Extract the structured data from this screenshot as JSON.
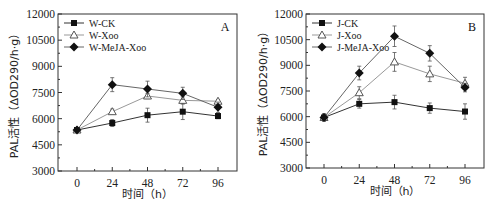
{
  "chart_data": [
    {
      "type": "line",
      "panel_label": "A",
      "title": "",
      "xlabel": "时间（h）",
      "ylabel": "PAL活性（ΔOD290/h·g）",
      "x": [
        0,
        24,
        48,
        72,
        96
      ],
      "x_ticks": [
        "0",
        "24",
        "48",
        "72",
        "96"
      ],
      "y_ticks": [
        "3000",
        "4500",
        "6000",
        "7500",
        "9000",
        "10500",
        "12000"
      ],
      "ylim": [
        3000,
        12000
      ],
      "grid": false,
      "legend_position": "upper-left",
      "series": [
        {
          "name": "W-CK",
          "marker": "filled-square",
          "values": [
            5350,
            5750,
            6200,
            6400,
            6150
          ],
          "errors": [
            80,
            200,
            400,
            450,
            150
          ]
        },
        {
          "name": "W-Xoo",
          "marker": "open-triangle",
          "values": [
            5350,
            6400,
            7300,
            7050,
            7000
          ],
          "errors": [
            80,
            150,
            150,
            200,
            100
          ]
        },
        {
          "name": "W-MeJA-Xoo",
          "marker": "filled-diamond",
          "values": [
            5350,
            7950,
            7700,
            7450,
            6650
          ],
          "errors": [
            80,
            400,
            450,
            350,
            300
          ]
        }
      ]
    },
    {
      "type": "line",
      "panel_label": "B",
      "title": "",
      "xlabel": "时间（h）",
      "ylabel": "PAL活性（ΔOD290/h·g）",
      "x": [
        0,
        24,
        48,
        72,
        96
      ],
      "x_ticks": [
        "0",
        "24",
        "48",
        "72",
        "96"
      ],
      "y_ticks": [
        "3000",
        "4500",
        "6000",
        "7500",
        "9000",
        "10500",
        "12000"
      ],
      "ylim": [
        3000,
        12000
      ],
      "grid": false,
      "legend_position": "upper-left",
      "series": [
        {
          "name": "J-CK",
          "marker": "filled-square",
          "values": [
            5950,
            6750,
            6850,
            6500,
            6300
          ],
          "errors": [
            200,
            250,
            400,
            300,
            450
          ]
        },
        {
          "name": "J-Xoo",
          "marker": "open-triangle",
          "values": [
            5950,
            7400,
            9200,
            8500,
            7950
          ],
          "errors": [
            200,
            350,
            550,
            450,
            350
          ]
        },
        {
          "name": "J-MeJA-Xoo",
          "marker": "filled-diamond",
          "values": [
            5950,
            8550,
            10700,
            9700,
            7700
          ],
          "errors": [
            200,
            400,
            600,
            450,
            250
          ]
        }
      ]
    }
  ]
}
